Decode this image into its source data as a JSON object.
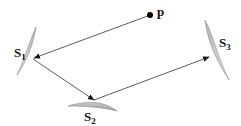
{
  "diagram": {
    "title": "",
    "point": {
      "label": "p"
    },
    "surfaces": [
      {
        "label": "S",
        "sub": "1"
      },
      {
        "label": "S",
        "sub": "2"
      },
      {
        "label": "S",
        "sub": "3"
      }
    ],
    "colors": {
      "line": "#333333",
      "surface_fill": "#cfcfcf",
      "surface_edge": "#8a8a8a",
      "point": "#000000"
    }
  }
}
